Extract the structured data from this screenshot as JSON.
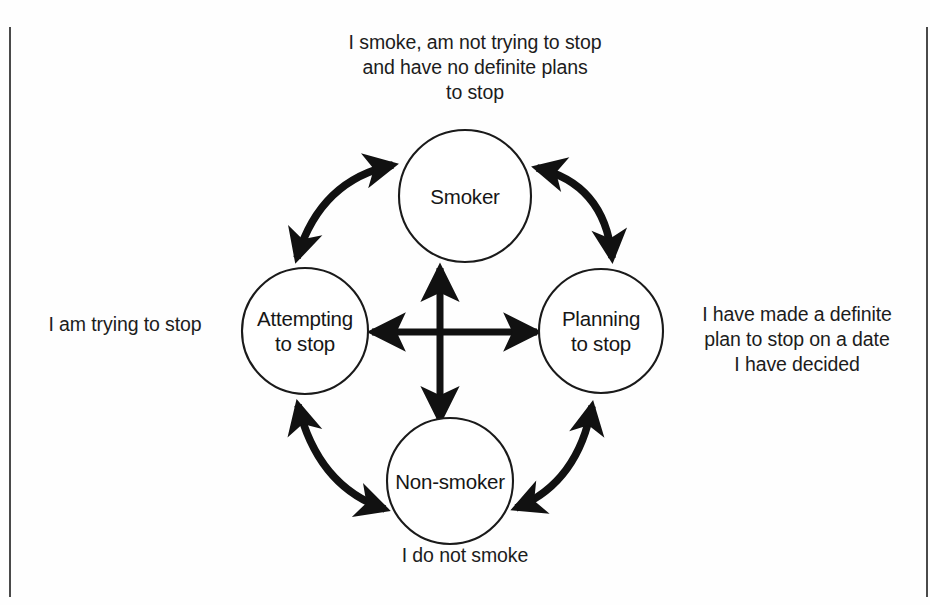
{
  "diagram": {
    "type": "cycle-state-diagram",
    "nodes": [
      {
        "id": "smoker",
        "label": "Smoker",
        "cx": 465,
        "cy": 196,
        "r": 66
      },
      {
        "id": "attempting",
        "label": "Attempting\nto stop",
        "cx": 305,
        "cy": 331,
        "r": 63
      },
      {
        "id": "planning",
        "label": "Planning\nto stop",
        "cx": 601,
        "cy": 331,
        "r": 62
      },
      {
        "id": "nonsmoker",
        "label": "Non-smoker",
        "cx": 450,
        "cy": 481,
        "r": 63
      }
    ],
    "captions": {
      "top": "I smoke, am not trying to stop\nand have no definite plans\nto stop",
      "right": "I have made a definite\nplan to stop on a date\nI have decided",
      "left": "I am trying to stop",
      "bottom": "I do not smoke"
    },
    "edges": [
      {
        "id": "smoker-attempting",
        "from": "smoker",
        "to": "attempting",
        "style": "curved",
        "heads": "both"
      },
      {
        "id": "smoker-planning",
        "from": "smoker",
        "to": "planning",
        "style": "curved",
        "heads": "both"
      },
      {
        "id": "attempting-nonsmoker",
        "from": "attempting",
        "to": "nonsmoker",
        "style": "curved",
        "heads": "both"
      },
      {
        "id": "planning-nonsmoker",
        "from": "planning",
        "to": "nonsmoker",
        "style": "curved",
        "heads": "both"
      },
      {
        "id": "cross-vertical",
        "from": "nonsmoker",
        "to": "smoker",
        "style": "straight",
        "heads": "both"
      },
      {
        "id": "cross-horizontal",
        "from": "attempting",
        "to": "planning",
        "style": "straight",
        "heads": "both"
      }
    ],
    "colors": {
      "stroke": "#111111",
      "circle_stroke": "#1a1a1a",
      "text": "#1a1a1a",
      "background": "#fefefe",
      "frame_rule": "#4a4a4a"
    }
  }
}
